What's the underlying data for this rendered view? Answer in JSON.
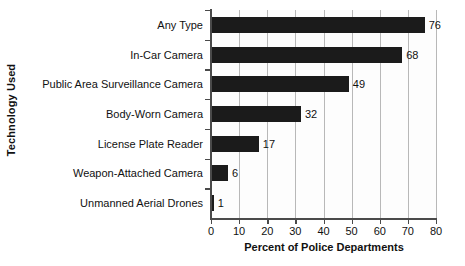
{
  "chart_data": {
    "type": "bar",
    "orientation": "horizontal",
    "title": "",
    "xlabel": "Percent of Police Departments",
    "ylabel": "Technology Used",
    "categories": [
      "Any Type",
      "In-Car Camera",
      "Public Area Surveillance Camera",
      "Body-Worn Camera",
      "License Plate Reader",
      "Weapon-Attached Camera",
      "Unmanned Aerial Drones"
    ],
    "values": [
      76,
      68,
      49,
      32,
      17,
      6,
      1
    ],
    "value_labels": [
      "76",
      "68",
      "49",
      "32",
      "17",
      "6",
      "1"
    ],
    "xlim": [
      0,
      80
    ],
    "xticks": [
      0,
      10,
      20,
      30,
      40,
      50,
      60,
      70,
      80
    ],
    "xtick_labels": [
      "0",
      "10",
      "20",
      "30",
      "40",
      "50",
      "60",
      "70",
      "80"
    ],
    "grid": true,
    "grid_axis": "x",
    "legend": false,
    "bar_color": "#1b1b1b",
    "grid_color": "#b8b8b8",
    "axis_color": "#4a4a4a",
    "background_color": "#ffffff"
  }
}
